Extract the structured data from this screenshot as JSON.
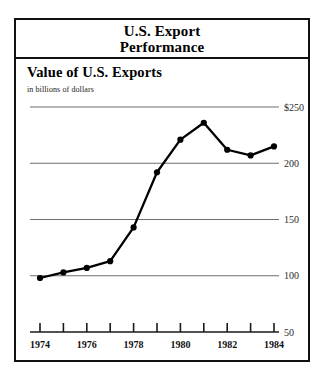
{
  "figure": {
    "title_line1": "U.S. Export",
    "title_line2": "Performance",
    "subtitle": "Value of U.S. Exports",
    "units": "in billions of dollars"
  },
  "chart_data": {
    "type": "line",
    "title": "Value of U.S. Exports",
    "subtitle": "in billions of dollars",
    "xlabel": "",
    "ylabel": "in billions of dollars",
    "x": [
      1974,
      1975,
      1976,
      1977,
      1978,
      1979,
      1980,
      1981,
      1982,
      1983,
      1984
    ],
    "values": [
      98,
      103,
      107,
      113,
      143,
      192,
      221,
      236,
      212,
      207,
      215
    ],
    "x_tick_values": [
      1974,
      1975,
      1976,
      1977,
      1978,
      1979,
      1980,
      1981,
      1982,
      1983,
      1984
    ],
    "x_tick_labels": [
      "1974",
      "",
      "1976",
      "",
      "1978",
      "",
      "1980",
      "",
      "1982",
      "",
      "1984"
    ],
    "y_ticks": [
      250,
      200,
      150,
      100,
      50
    ],
    "y_tick_labels": [
      "$250",
      "200",
      "150",
      "100",
      "50"
    ],
    "xlim": [
      1974,
      1984
    ],
    "ylim": [
      50,
      250
    ],
    "grid": true,
    "legend": false,
    "markers": "filled-circle",
    "line_color": "#000000",
    "grid_color": "#6e6e6e"
  },
  "colors": {
    "frame": "#111111",
    "line": "#000000",
    "grid": "#6e6e6e",
    "background": "#ffffff"
  }
}
